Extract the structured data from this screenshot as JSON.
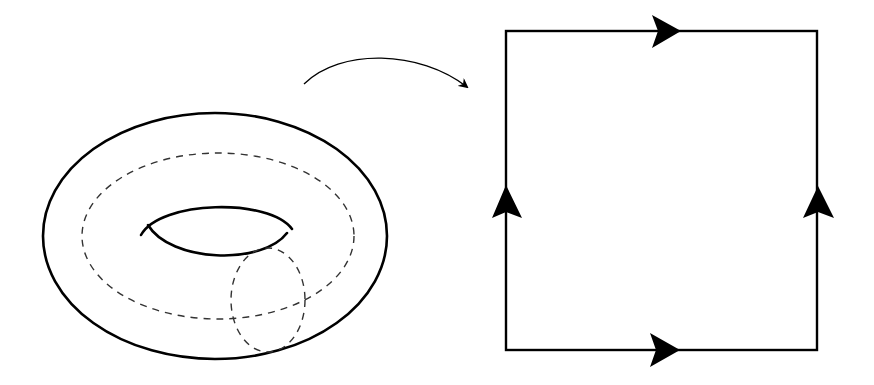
{
  "diagram": {
    "colors": {
      "background": "#ffffff",
      "stroke": "#000000",
      "dashed": "#333333"
    },
    "torus": {
      "outer_ellipse": {
        "cx": 215,
        "cy": 236,
        "rx": 172,
        "ry": 123
      },
      "longitude_loop": {
        "style": "dashed",
        "cx": 218,
        "cy": 236,
        "rx": 136,
        "ry": 83
      },
      "meridian_loop": {
        "style": "dashed",
        "cx": 268,
        "cy": 300,
        "rx": 37,
        "ry": 52
      },
      "hole": {
        "style": "solid"
      }
    },
    "mapping_arrow": {
      "from": [
        303,
        84
      ],
      "to": [
        468,
        88
      ],
      "direction": "torus-to-square"
    },
    "square": {
      "x": 506,
      "y": 31,
      "width": 311,
      "height": 319,
      "edge_arrows": [
        {
          "edge": "top",
          "direction": "right"
        },
        {
          "edge": "bottom",
          "direction": "right"
        },
        {
          "edge": "left",
          "direction": "up"
        },
        {
          "edge": "right",
          "direction": "up"
        }
      ]
    }
  }
}
